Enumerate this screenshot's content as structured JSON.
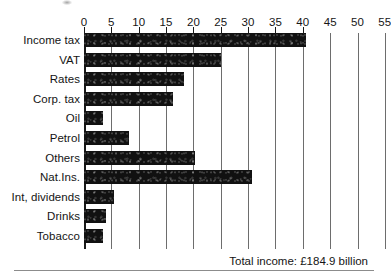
{
  "chart_data": {
    "type": "bar",
    "orientation": "horizontal",
    "title": "",
    "subtitle": "",
    "xlabel": "",
    "ylabel": "",
    "xlim": [
      0,
      57
    ],
    "axis_ticks": [
      0,
      5,
      10,
      15,
      20,
      25,
      30,
      35,
      40,
      45,
      50,
      55
    ],
    "tick_labels": [
      "0",
      "5",
      "10",
      "15",
      "20",
      "25",
      "30",
      "35",
      "40",
      "45",
      "50",
      "55"
    ],
    "grid": true,
    "legend": null,
    "units": "£ billion",
    "categories": [
      "Income tax",
      "VAT",
      "Rates",
      "Corp. tax",
      "Oil",
      "Petrol",
      "Others",
      "Nat.Ins.",
      "Int, dividends",
      "Drinks",
      "Tobacco"
    ],
    "values": [
      40.5,
      25.0,
      18.3,
      16.3,
      3.5,
      8.3,
      20.3,
      30.7,
      5.5,
      4.0,
      3.5
    ],
    "annotation": "Total income: £184.9 billion",
    "colors": {
      "bar": "#111111",
      "gridline": "#6d6d6d",
      "axis": "#1a1a1a",
      "text": "#141414",
      "background": "#ffffff"
    }
  },
  "footer": {
    "total_label": "Total income: £184.9 billion"
  }
}
